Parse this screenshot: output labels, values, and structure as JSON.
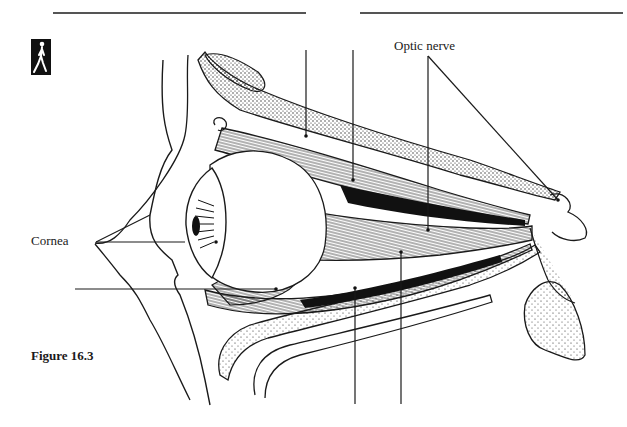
{
  "page": {
    "figure_caption": "Figure 16.3",
    "icon": "walking-figure-icon"
  },
  "diagram": {
    "labels": [
      {
        "id": "optic-nerve",
        "text": "Optic nerve"
      },
      {
        "id": "cornea",
        "text": "Cornea"
      }
    ],
    "blank_leader_lines": [
      {
        "id": "top-1",
        "position": "top",
        "x": 306
      },
      {
        "id": "top-2",
        "position": "top",
        "x": 353
      },
      {
        "id": "left-lower",
        "position": "left",
        "y": 289
      },
      {
        "id": "bottom-1",
        "position": "bottom",
        "x": 355
      },
      {
        "id": "bottom-2",
        "position": "bottom",
        "x": 401
      }
    ],
    "colors": {
      "ink": "#1a1a1a",
      "paper": "#ffffff",
      "rule": "#555555"
    }
  }
}
